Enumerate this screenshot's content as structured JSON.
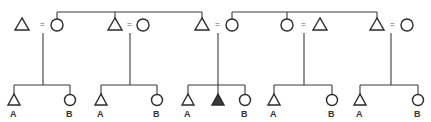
{
  "diagram": {
    "type": "kinship-chart",
    "symbols": {
      "male": "triangle",
      "female": "circle",
      "marriage": "=",
      "ego": "filled-triangle"
    },
    "couples": [
      {
        "id": "c1",
        "left": "triangle",
        "right": "circle",
        "marriage_sign": "="
      },
      {
        "id": "c2",
        "left": "triangle",
        "right": "circle",
        "marriage_sign": "="
      },
      {
        "id": "c3",
        "left": "triangle",
        "right": "circle",
        "marriage_sign": "="
      },
      {
        "id": "c4",
        "left": "circle",
        "right": "triangle",
        "marriage_sign": "="
      },
      {
        "id": "c5",
        "left": "triangle",
        "right": "circle",
        "marriage_sign": "="
      }
    ],
    "sibling_sets": [
      {
        "members": [
          "c1.circle",
          "c2.triangle",
          "c3.triangle"
        ]
      },
      {
        "members": [
          "c3.circle",
          "c4.circle",
          "c5.triangle"
        ]
      }
    ],
    "children": [
      {
        "parents": "c1",
        "items": [
          {
            "symbol": "triangle",
            "label": "A"
          },
          {
            "symbol": "circle",
            "label": "B"
          }
        ]
      },
      {
        "parents": "c2",
        "items": [
          {
            "symbol": "triangle",
            "label": "A"
          },
          {
            "symbol": "circle",
            "label": "B"
          }
        ]
      },
      {
        "parents": "c3",
        "items": [
          {
            "symbol": "triangle",
            "label": "A"
          },
          {
            "symbol": "filled-triangle",
            "label": ""
          },
          {
            "symbol": "circle",
            "label": "B"
          }
        ]
      },
      {
        "parents": "c4",
        "items": [
          {
            "symbol": "triangle",
            "label": "A"
          },
          {
            "symbol": "circle",
            "label": "B"
          }
        ]
      },
      {
        "parents": "c5",
        "items": [
          {
            "symbol": "triangle",
            "label": "A"
          },
          {
            "symbol": "circle",
            "label": "B"
          }
        ]
      }
    ],
    "labels": {
      "a": "A",
      "b": "B",
      "eq": "="
    }
  }
}
